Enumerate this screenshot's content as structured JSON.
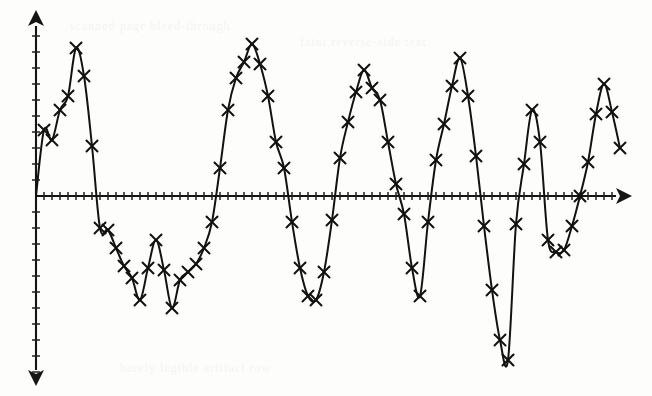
{
  "axes": {
    "x_axis_name": "horizontal-axis",
    "y_axis_name": "vertical-axis",
    "x_axis_label": "",
    "y_axis_label": "",
    "origin_px": {
      "x": 36,
      "y": 196
    },
    "x_axis_start_px": 36,
    "x_axis_end_px": 624,
    "y_axis_top_px": 18,
    "y_axis_bottom_px": 378,
    "x_tick_spacing_px": 8,
    "y_tick_spacing_px": 16,
    "x_tick_count": 72,
    "y_tick_count_above": 11,
    "y_tick_count_below": 11,
    "x_tick_half_len_px": 4,
    "y_tick_half_len_px": 4,
    "arrow_heads": [
      "up",
      "right",
      "down"
    ]
  },
  "style": {
    "ink_color": "#121212",
    "axis_color": "#151515",
    "background_color": "#fdfdfc",
    "marker_glyph": "x",
    "marker_size_px": 11,
    "curve_stroke_width": 2.0
  },
  "chart_data": {
    "type": "line",
    "subtitle": "",
    "xlabel": "",
    "ylabel": "",
    "xlim": [
      0,
      73
    ],
    "ylim": [
      -11,
      11
    ],
    "grid": false,
    "legend": null,
    "legend_position": "none",
    "markers": "x",
    "annotations": [],
    "x_tick_labels": [],
    "y_tick_labels": [],
    "series": [
      {
        "name": "signal",
        "color": "#121212",
        "x": [
          0,
          1,
          2,
          3,
          4,
          5,
          6,
          7,
          8,
          9,
          10,
          11,
          12,
          13,
          14,
          15,
          16,
          17,
          18,
          19,
          20,
          21,
          22,
          23,
          24,
          25,
          26,
          27,
          28,
          29,
          30,
          31,
          32,
          33,
          34,
          35,
          36,
          37,
          38,
          39,
          40,
          41,
          42,
          43,
          44,
          45,
          46,
          47,
          48,
          49,
          50,
          51,
          52,
          53,
          54,
          55,
          56,
          57,
          58,
          59,
          60,
          61,
          62,
          63,
          64,
          65,
          66,
          67,
          68,
          69,
          70,
          71,
          72,
          73
        ],
        "y": [
          0.0,
          3.5,
          5.3,
          6.6,
          8.2,
          8.8,
          7.1,
          3.2,
          -1.7,
          -2.0,
          -3.3,
          -4.4,
          -5.1,
          -6.3,
          -4.3,
          -2.8,
          -4.5,
          -6.9,
          -5.2,
          -4.7,
          -4.1,
          -3.0,
          -1.5,
          1.6,
          5.0,
          7.2,
          8.4,
          9.2,
          8.1,
          6.2,
          3.4,
          1.6,
          -1.4,
          -4.1,
          -6.0,
          -6.2,
          -4.4,
          -1.3,
          2.2,
          4.5,
          6.3,
          7.7,
          6.6,
          5.8,
          3.3,
          0.8,
          -1.0,
          -4.3,
          -6.0,
          -1.5,
          2.2,
          4.4,
          6.7,
          8.3,
          6.1,
          2.4,
          -1.7,
          -5.5,
          -8.5,
          -9.7,
          -1.6,
          2.0,
          5.3,
          3.2,
          -2.6,
          -3.4,
          -3.3,
          -1.8,
          0.0,
          2.1,
          5.1,
          6.9,
          5.3,
          2.9
        ],
        "note": "values expressed in y-axis tick units (1 tick = 16 px)"
      }
    ],
    "sample_points_px": [
      [
        36,
        196
      ],
      [
        44,
        130
      ],
      [
        52,
        140
      ],
      [
        60,
        110
      ],
      [
        68,
        96
      ],
      [
        76,
        48
      ],
      [
        84,
        76
      ],
      [
        92,
        146
      ],
      [
        100,
        228
      ],
      [
        108,
        230
      ],
      [
        116,
        248
      ],
      [
        124,
        266
      ],
      [
        132,
        278
      ],
      [
        140,
        300
      ],
      [
        148,
        268
      ],
      [
        156,
        240
      ],
      [
        164,
        270
      ],
      [
        172,
        308
      ],
      [
        180,
        280
      ],
      [
        188,
        272
      ],
      [
        196,
        264
      ],
      [
        204,
        248
      ],
      [
        212,
        222
      ],
      [
        220,
        168
      ],
      [
        228,
        110
      ],
      [
        236,
        78
      ],
      [
        244,
        62
      ],
      [
        252,
        44
      ],
      [
        260,
        64
      ],
      [
        268,
        96
      ],
      [
        276,
        142
      ],
      [
        284,
        168
      ],
      [
        292,
        222
      ],
      [
        300,
        268
      ],
      [
        308,
        296
      ],
      [
        316,
        300
      ],
      [
        324,
        272
      ],
      [
        332,
        220
      ],
      [
        340,
        158
      ],
      [
        348,
        122
      ],
      [
        356,
        92
      ],
      [
        364,
        70
      ],
      [
        372,
        88
      ],
      [
        380,
        100
      ],
      [
        388,
        142
      ],
      [
        396,
        184
      ],
      [
        404,
        214
      ],
      [
        412,
        268
      ],
      [
        420,
        296
      ],
      [
        428,
        222
      ],
      [
        436,
        160
      ],
      [
        444,
        124
      ],
      [
        452,
        86
      ],
      [
        460,
        58
      ],
      [
        468,
        96
      ],
      [
        476,
        156
      ],
      [
        484,
        226
      ],
      [
        492,
        290
      ],
      [
        500,
        340
      ],
      [
        508,
        360
      ],
      [
        516,
        224
      ],
      [
        524,
        164
      ],
      [
        532,
        110
      ],
      [
        540,
        142
      ],
      [
        548,
        240
      ],
      [
        556,
        252
      ],
      [
        564,
        250
      ],
      [
        572,
        226
      ],
      [
        580,
        196
      ],
      [
        588,
        162
      ],
      [
        596,
        114
      ],
      [
        604,
        84
      ],
      [
        612,
        112
      ],
      [
        620,
        148
      ]
    ]
  },
  "background_artifacts": {
    "note": "faint ghosted text bleed-through from reverse side of scanned page",
    "lines": [
      "scanned page bleed-through",
      "faint reverse-side text",
      "barely legible artifact row"
    ]
  }
}
